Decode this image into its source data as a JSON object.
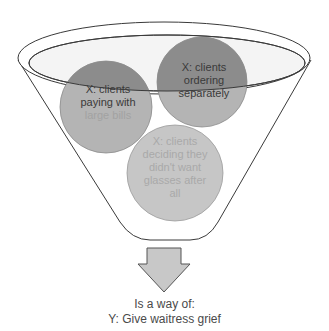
{
  "diagram": {
    "type": "funnel",
    "colors": {
      "background": "#ffffff",
      "funnel_fill": "#ffffff",
      "funnel_stroke": "#3a3a3a",
      "inner_ellipse_fill": "#f4f4f4",
      "circle_dark": "#8c8c8c",
      "circle_mid": "#a8a8a8",
      "circle_light": "#c6c6c6",
      "text_dark": "#3a3a3a",
      "text_light": "#a9a9a9",
      "arrow_fill": "#c8c8c8",
      "arrow_stroke": "#555555"
    },
    "inputs": [
      {
        "id": "x1",
        "label_lines": [
          "X: clients",
          "paying with",
          "large bills"
        ]
      },
      {
        "id": "x2",
        "label_lines": [
          "X: clients",
          "ordering",
          "separately"
        ]
      },
      {
        "id": "x3",
        "label_lines": [
          "X: clients",
          "deciding they",
          "didn't want",
          "glasses after",
          "all"
        ]
      }
    ],
    "arrow_icon": "down-arrow-icon",
    "output": {
      "connector": "Is a way of:",
      "result": "Y: Give waitress grief"
    }
  }
}
